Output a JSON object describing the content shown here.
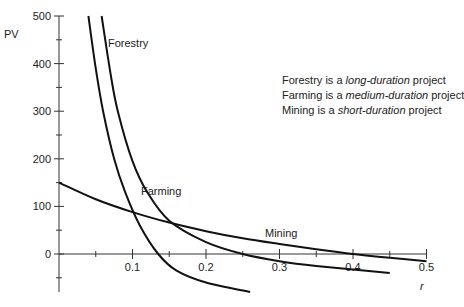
{
  "chart_data": {
    "type": "line",
    "title": "",
    "xlabel": "r",
    "ylabel": "PV",
    "xlim": [
      0,
      0.5
    ],
    "ylim": [
      -80,
      500
    ],
    "x_ticks": [
      "0.1",
      "0.2",
      "0.3",
      "0.4",
      "0.5"
    ],
    "y_ticks": [
      "0",
      "100",
      "200",
      "300",
      "400",
      "500"
    ],
    "grid": false,
    "series": [
      {
        "name": "Forestry",
        "x": [
          0.04,
          0.05,
          0.06,
          0.075,
          0.09,
          0.11,
          0.135,
          0.16,
          0.2,
          0.26
        ],
        "values": [
          500,
          390,
          300,
          200,
          130,
          60,
          0,
          -35,
          -60,
          -80
        ]
      },
      {
        "name": "Farming",
        "x": [
          0.058,
          0.07,
          0.08,
          0.1,
          0.12,
          0.15,
          0.2,
          0.25,
          0.3,
          0.35,
          0.45
        ],
        "values": [
          500,
          380,
          300,
          195,
          130,
          70,
          25,
          0,
          -15,
          -25,
          -40
        ]
      },
      {
        "name": "Mining",
        "x": [
          0,
          0.05,
          0.1,
          0.15,
          0.2,
          0.25,
          0.3,
          0.35,
          0.4,
          0.45,
          0.5
        ],
        "values": [
          150,
          115,
          88,
          66,
          48,
          33,
          21,
          10,
          0,
          -8,
          -15
        ]
      }
    ],
    "annotations": [
      "Forestry is a long-duration project",
      "Farming is a medium-duration project",
      "Mining is a short-duration project"
    ]
  },
  "labels": {
    "ylabel": "PV",
    "xlabel": "r",
    "forestry": "Forestry",
    "farming": "Farming",
    "mining": "Mining"
  },
  "notes": [
    {
      "subject": "Forestry is a ",
      "emph": "long-duration",
      "tail": " project"
    },
    {
      "subject": "Farming is a ",
      "emph": "medium-duration",
      "tail": " project"
    },
    {
      "subject": "Mining is a ",
      "emph": "short-duration",
      "tail": " project"
    }
  ]
}
